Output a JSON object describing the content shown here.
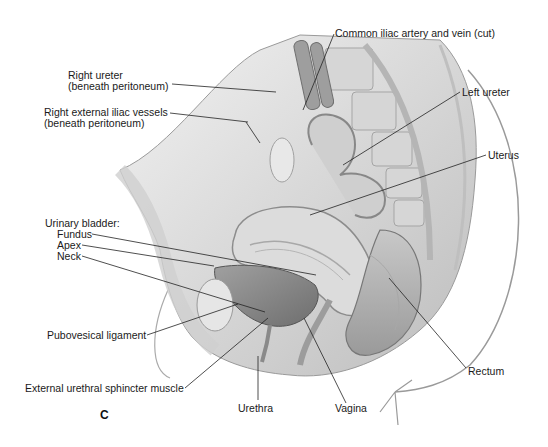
{
  "figure": {
    "panel_letter": "C",
    "colors": {
      "background": "#ffffff",
      "tissue_light": "#d9d9d9",
      "tissue_mid": "#b8b8b8",
      "tissue_dark": "#8c8c8c",
      "bladder": "#8a8a8a",
      "leader_line": "#222222",
      "label_text": "#1a1a1a"
    }
  },
  "labels": {
    "right_ureter": {
      "line1": "Right ureter",
      "line2": "(beneath peritoneum)"
    },
    "right_external_iliac": {
      "line1": "Right external iliac vessels",
      "line2": "(beneath peritoneum)"
    },
    "common_iliac": "Common iliac artery and vein (cut)",
    "left_ureter": "Left ureter",
    "uterus": "Uterus",
    "urinary_bladder": {
      "heading": "Urinary bladder:",
      "fundus": "Fundus",
      "apex": "Apex",
      "neck": "Neck"
    },
    "pubovesical_ligament": "Pubovesical ligament",
    "external_urethral_sphincter": "External urethral sphincter muscle",
    "urethra": "Urethra",
    "vagina": "Vagina",
    "rectum": "Rectum"
  }
}
